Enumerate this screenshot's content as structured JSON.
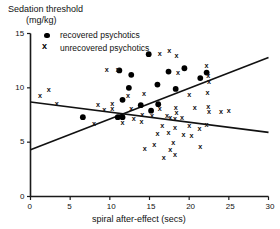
{
  "chart_data": {
    "type": "scatter",
    "title": "Sedation threshold (mg/kg)",
    "title_line1": "Sedation threshold",
    "title_line2": "(mg/kg)",
    "xlabel": "spiral after-effect (secs)",
    "ylabel": "Sedation threshold (mg/kg)",
    "xlim": [
      0,
      30
    ],
    "ylim": [
      0,
      15
    ],
    "xticks": [
      0,
      5,
      10,
      15,
      20,
      25,
      30
    ],
    "yticks": [
      0,
      5,
      10,
      15
    ],
    "xtick_labels": [
      "0",
      "5",
      "10",
      "15",
      "20",
      "25",
      "30"
    ],
    "ytick_labels": [
      "0",
      "5",
      "10",
      "15"
    ],
    "grid": false,
    "legend_position": "top-left",
    "marker_colors": {
      "recovered": "#000000",
      "unrecovered": "#000000"
    },
    "series": [
      {
        "name": "recovered psychotics",
        "marker": "filled-circle",
        "points": [
          [
            14.9,
            13.1
          ],
          [
            11.2,
            11.6
          ],
          [
            12.7,
            11.2
          ],
          [
            17.4,
            11.5
          ],
          [
            19.4,
            11.8
          ],
          [
            22.2,
            11.4
          ],
          [
            16.0,
            10.3
          ],
          [
            21.4,
            10.9
          ],
          [
            18.3,
            9.9
          ],
          [
            12.4,
            10.0
          ],
          [
            11.6,
            8.9
          ],
          [
            13.9,
            8.4
          ],
          [
            16.1,
            8.5
          ],
          [
            6.6,
            7.3
          ],
          [
            11.0,
            7.3
          ],
          [
            11.6,
            7.3
          ],
          [
            15.2,
            7.9
          ]
        ]
      },
      {
        "name": "unrecovered psychotics",
        "marker": "x",
        "points": [
          [
            16.3,
            13.2
          ],
          [
            17.5,
            13.4
          ],
          [
            18.4,
            13.0
          ],
          [
            9.6,
            11.7
          ],
          [
            11.0,
            11.7
          ],
          [
            18.6,
            11.4
          ],
          [
            22.2,
            12.1
          ],
          [
            22.4,
            11.1
          ],
          [
            22.5,
            10.6
          ],
          [
            2.3,
            9.9
          ],
          [
            1.2,
            9.3
          ],
          [
            12.3,
            9.3
          ],
          [
            14.3,
            9.5
          ],
          [
            20.0,
            9.4
          ],
          [
            22.3,
            9.6
          ],
          [
            3.3,
            8.6
          ],
          [
            8.5,
            8.5
          ],
          [
            10.3,
            8.6
          ],
          [
            10.3,
            8.1
          ],
          [
            9.3,
            8.0
          ],
          [
            12.7,
            8.1
          ],
          [
            16.3,
            8.1
          ],
          [
            18.3,
            8.2
          ],
          [
            18.4,
            7.7
          ],
          [
            20.7,
            8.2
          ],
          [
            22.4,
            8.3
          ],
          [
            22.5,
            7.8
          ],
          [
            24.0,
            7.8
          ],
          [
            25.0,
            7.9
          ],
          [
            14.1,
            7.6
          ],
          [
            15.3,
            7.5
          ],
          [
            17.2,
            7.5
          ],
          [
            17.6,
            7.3
          ],
          [
            18.2,
            7.2
          ],
          [
            19.1,
            7.3
          ],
          [
            13.0,
            7.2
          ],
          [
            11.6,
            6.8
          ],
          [
            14.0,
            6.9
          ],
          [
            8.0,
            6.7
          ],
          [
            16.6,
            6.5
          ],
          [
            18.2,
            6.4
          ],
          [
            20.0,
            6.5
          ],
          [
            21.3,
            6.3
          ],
          [
            22.2,
            6.6
          ],
          [
            16.0,
            5.8
          ],
          [
            17.4,
            5.9
          ],
          [
            19.3,
            5.7
          ],
          [
            20.3,
            5.6
          ],
          [
            18.0,
            5.0
          ],
          [
            15.6,
            4.8
          ],
          [
            14.4,
            4.4
          ],
          [
            17.6,
            4.3
          ],
          [
            21.4,
            4.6
          ],
          [
            16.8,
            3.6
          ],
          [
            18.2,
            3.9
          ]
        ]
      }
    ],
    "lines": [
      {
        "name": "unrecovered-regression",
        "x0": 0,
        "y0": 8.7,
        "x1": 30,
        "y1": 5.9
      },
      {
        "name": "recovered-regression",
        "x0": 0,
        "y0": 4.3,
        "x1": 30,
        "y1": 12.8
      }
    ]
  },
  "legend": {
    "recovered_label": "recovered psychotics",
    "unrecovered_label": "unrecovered psychotics",
    "recovered_marker": "filled-circle-icon",
    "unrecovered_marker": "x-cross-icon"
  }
}
